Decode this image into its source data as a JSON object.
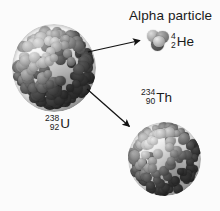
{
  "figure": {
    "background_color": "#fbfbfb",
    "width": 220,
    "height": 211
  },
  "labels": {
    "alpha_particle": "Alpha particle"
  },
  "isotopes": {
    "uranium": {
      "symbol": "U",
      "mass_number": "238",
      "atomic_number": "92",
      "name": "uranium-238"
    },
    "thorium": {
      "symbol": "Th",
      "mass_number": "234",
      "atomic_number": "90",
      "name": "thorium-234"
    },
    "helium": {
      "symbol": "He",
      "mass_number": "4",
      "atomic_number": "2",
      "name": "helium-4"
    }
  },
  "nuclei": {
    "uranium": {
      "shape": "sphere-of-nucleons",
      "nucleon_count_drawn": 150,
      "color_light": "#e3e3e3",
      "color_mid": "#9a9a9a",
      "color_dark": "#4a4a4a"
    },
    "thorium": {
      "shape": "sphere-of-nucleons",
      "nucleon_count_drawn": 120,
      "color_light": "#e3e3e3",
      "color_mid": "#9a9a9a",
      "color_dark": "#4a4a4a"
    },
    "alpha": {
      "shape": "four-nucleon-cluster",
      "nucleon_count_drawn": 4,
      "color_light": "#dcdcdc",
      "color_mid": "#8e8e8e",
      "color_dark": "#3e3e3e"
    }
  },
  "arrows": {
    "to_alpha": {
      "from_x": 88,
      "from_y": 52,
      "to_x": 143,
      "to_y": 40,
      "color": "#111111"
    },
    "to_thorium": {
      "from_x": 87,
      "from_y": 89,
      "to_x": 132,
      "to_y": 129,
      "color": "#111111"
    }
  }
}
